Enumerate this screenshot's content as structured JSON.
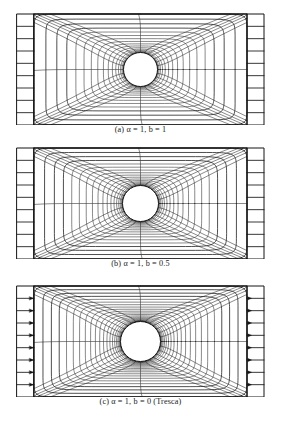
{
  "figure": {
    "name": "slip-line-mesh-figure",
    "background_color": "#ffffff",
    "line_color": "#141414",
    "hole_fill": "#ffffff",
    "panel_count": 3
  },
  "panels": [
    {
      "id": "panel-a",
      "caption": "(a)  α = 1,  b = 1",
      "caption_label": "(a)",
      "alpha": 1,
      "b": 1,
      "note": "",
      "hole_radius": 17,
      "frame": {
        "x": 17,
        "y": 14,
        "width": 247,
        "height": 111
      },
      "edge_arrows": false
    },
    {
      "id": "panel-b",
      "caption": "(b)  α = 1,  b = 0.5",
      "caption_label": "(b)",
      "alpha": 1,
      "b": 0.5,
      "note": "",
      "hole_radius": 18,
      "frame": {
        "x": 17,
        "y": 14,
        "width": 247,
        "height": 111
      },
      "edge_arrows": false
    },
    {
      "id": "panel-c",
      "caption": "(c)  α = 1,  b = 0  (Tresca)",
      "caption_label": "(c)",
      "alpha": 1,
      "b": 0,
      "note": "Tresca",
      "hole_radius": 20,
      "frame": {
        "x": 17,
        "y": 14,
        "width": 247,
        "height": 111
      },
      "edge_arrows": true
    }
  ],
  "chart_data": {
    "type": "diagram",
    "title": "",
    "subtitle": "",
    "series": [
      {
        "name": "panel-a",
        "alpha": 1,
        "b": 1,
        "hole_radius_px": 17,
        "ring_count": 17,
        "spoke_count": 28
      },
      {
        "name": "panel-b",
        "alpha": 1,
        "b": 0.5,
        "hole_radius_px": 18,
        "ring_count": 19,
        "spoke_count": 28
      },
      {
        "name": "panel-c",
        "alpha": 1,
        "b": 0,
        "hole_radius_px": 20,
        "ring_count": 22,
        "spoke_count": 28
      }
    ],
    "xlabel": "",
    "ylabel": "",
    "legend": []
  }
}
